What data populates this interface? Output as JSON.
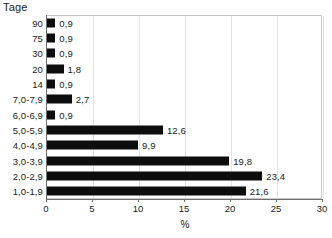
{
  "chart_data": {
    "type": "bar",
    "orientation": "horizontal",
    "title": "",
    "ylabel": "Tage",
    "xlabel": "%",
    "xlim": [
      0,
      30
    ],
    "xticks": [
      0,
      5,
      10,
      15,
      20,
      25,
      30
    ],
    "xtick_labels": [
      "0",
      "5",
      "10",
      "15",
      "20",
      "25",
      "30"
    ],
    "grid": true,
    "grid_axis": "x",
    "legend": false,
    "bar_color": "#0d0d0d",
    "categories": [
      "90",
      "75",
      "30",
      "20",
      "14",
      "7,0-7,9",
      "6,0-6,9",
      "5,0-5,9",
      "4,0-4,9",
      "3,0-3,9",
      "2,0-2,9",
      "1,0-1,9"
    ],
    "values": [
      0.9,
      0.9,
      0.9,
      1.8,
      0.9,
      2.7,
      0.9,
      12.6,
      9.9,
      19.8,
      23.4,
      21.6
    ],
    "value_labels": [
      "0,9",
      "0,9",
      "0,9",
      "1,8",
      "0,9",
      "2,7",
      "0,9",
      "12,6",
      "9,9",
      "19,8",
      "23,4",
      "21,6"
    ]
  }
}
